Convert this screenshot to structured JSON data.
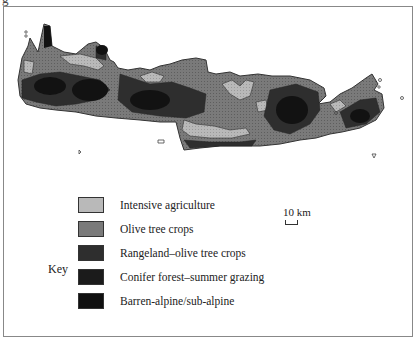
{
  "figure": {
    "cropped_title_fragment": "g",
    "region_depicted": "Crete island land-use map"
  },
  "legend": {
    "title": "Key",
    "items": [
      {
        "label": "Intensive agriculture",
        "color": "#b9b9b9"
      },
      {
        "label": "Olive tree crops",
        "color": "#7a7a7a"
      },
      {
        "label": "Rangeland–olive tree crops",
        "color": "#2e2e2e"
      },
      {
        "label": "Conifer forest–summer grazing",
        "color": "#1b1b1b"
      },
      {
        "label": "Barren-alpine/sub-alpine",
        "color": "#101010"
      }
    ]
  },
  "scale": {
    "label": "10 km"
  },
  "colors": {
    "frame": "#888888",
    "background": "#ffffff",
    "outline": "#333333"
  }
}
